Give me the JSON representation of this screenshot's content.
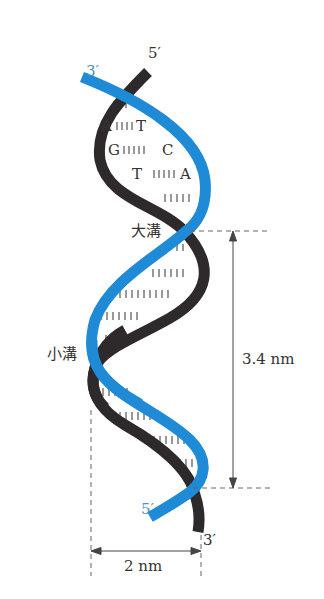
{
  "diagram": {
    "colors": {
      "strand_dark": "#2e2a2b",
      "strand_blue": "#1f8ad6",
      "label_blue": "#4a90c8",
      "text": "#333333",
      "guide": "#666666"
    },
    "strand_ends": {
      "dark_top": "5′",
      "blue_top": "3′",
      "blue_bottom": "5′",
      "dark_bottom": "3′"
    },
    "base_pairs": [
      {
        "left": "A",
        "right": "T"
      },
      {
        "left": "G",
        "right": "C"
      },
      {
        "left": "T",
        "right": "A"
      }
    ],
    "grooves": {
      "major": "大溝",
      "minor": "小溝"
    },
    "dimensions": {
      "pitch": "3.4 nm",
      "diameter": "2 nm"
    }
  }
}
